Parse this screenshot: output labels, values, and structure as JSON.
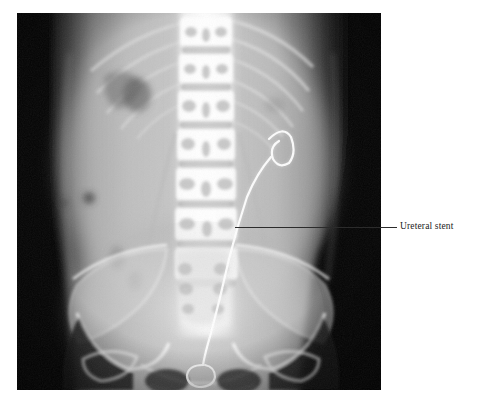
{
  "figure": {
    "type": "radiograph",
    "modality": "X-ray",
    "view": "AP abdomen and pelvis",
    "background_color": "#ffffff"
  },
  "annotations": [
    {
      "label": "Ureteral stent",
      "leader_line": true,
      "leader_color": "#2b2b2b",
      "points_to": "double-J ureteral stent projected over the right ureter"
    }
  ],
  "image_regions": {
    "spine_label": "lumbar spine",
    "pelvis_label": "bony pelvis",
    "gas_label": "bowel gas"
  }
}
